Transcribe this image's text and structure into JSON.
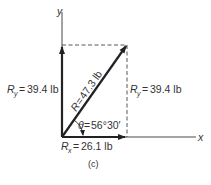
{
  "figure": {
    "caption": "(c)",
    "axes": {
      "x_label": "x",
      "y_label": "y"
    },
    "vectors": {
      "resultant": {
        "symbol": "R",
        "equals": "=",
        "value": "47.3 lb"
      },
      "x_component": {
        "symbol": "R",
        "subscript": "x",
        "equals": "=",
        "value": "26.1 lb"
      },
      "y_component_left": {
        "symbol": "R",
        "subscript": "y",
        "equals": "=",
        "value": "39.4 lb"
      },
      "y_component_right": {
        "symbol": "R",
        "subscript": "y",
        "equals": "=",
        "value": "39.4 lb"
      }
    },
    "angle": {
      "symbol": "θ",
      "equals": "=",
      "value": "56°30′"
    },
    "colors": {
      "line": "#333333",
      "vector": "#222222",
      "dashed": "#444444",
      "background": "#ffffff"
    }
  }
}
